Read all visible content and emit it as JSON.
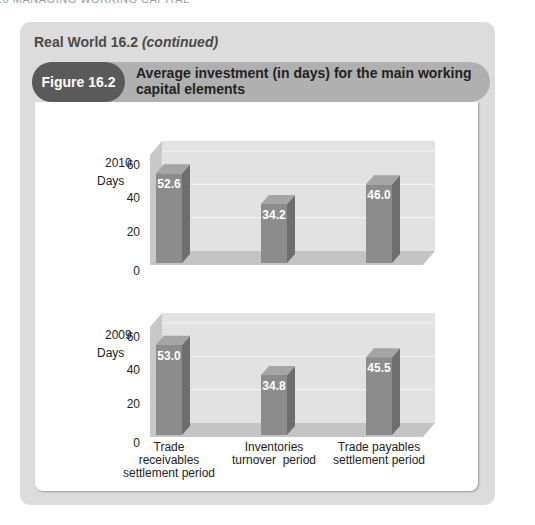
{
  "running_head": "16   MANAGING WORKING CAPITAL",
  "box": {
    "title": "Real World 16.2",
    "title_suffix": "(continued)"
  },
  "figure": {
    "number": "Figure 16.2",
    "title": "Average investment (in days) for the main working capital elements"
  },
  "colors": {
    "bar_front": "#8c8c8c",
    "bar_side": "#6e6e6e",
    "bar_top": "#a5a5a5",
    "wall": "#e2e2e2",
    "side_wall": "#c8c8c8",
    "floor": "#c4c4c4",
    "pill": "#5a5a5a",
    "header_band": "#b0b0b0",
    "outer_box": "#dcdcdc"
  },
  "axis": {
    "ylabel": "Days",
    "ticks": [
      "0",
      "20",
      "40",
      "60"
    ]
  },
  "categories": [
    [
      "Trade",
      "receivables",
      "settlement period"
    ],
    [
      "Inventories",
      "turnover  period"
    ],
    [
      "Trade payables",
      "settlement period"
    ]
  ],
  "chart_data": [
    {
      "type": "bar",
      "title": "2010",
      "categories": [
        "Trade receivables settlement period",
        "Inventories turnover period",
        "Trade payables settlement period"
      ],
      "values": [
        52.6,
        34.2,
        46.0
      ],
      "value_labels": [
        "52.6",
        "34.2",
        "46.0"
      ],
      "xlabel": "",
      "ylabel": "Days",
      "ylim": [
        0,
        60
      ],
      "yticks": [
        0,
        20,
        40,
        60
      ],
      "grid": true,
      "style": "3d"
    },
    {
      "type": "bar",
      "title": "2009",
      "categories": [
        "Trade receivables settlement period",
        "Inventories turnover period",
        "Trade payables settlement period"
      ],
      "values": [
        53.0,
        34.8,
        45.5
      ],
      "value_labels": [
        "53.0",
        "34.8",
        "45.5"
      ],
      "xlabel": "",
      "ylabel": "Days",
      "ylim": [
        0,
        60
      ],
      "yticks": [
        0,
        20,
        40,
        60
      ],
      "grid": true,
      "style": "3d"
    }
  ]
}
